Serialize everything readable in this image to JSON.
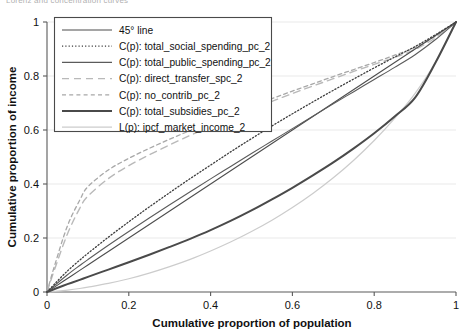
{
  "clipped_header": "Lorenz and concentration curves",
  "axes": {
    "xlabel": "Cumulative proportion of population",
    "ylabel": "Cumulative proportion of income",
    "xticks": [
      "0",
      "0.2",
      "0.4",
      "0.6",
      "0.8",
      "1"
    ],
    "yticks": [
      "0",
      "0.2",
      "0.4",
      "0.6",
      "0.8",
      "1"
    ]
  },
  "legend": {
    "items": [
      {
        "label": "45° line",
        "style": "solid",
        "color": "#4d4d4d"
      },
      {
        "label": "C(p): total_social_spending_pc_2",
        "style": "dotted",
        "color": "#3d3d3d"
      },
      {
        "label": "C(p): total_public_spending_pc_2",
        "style": "solid",
        "color": "#5b5b5b"
      },
      {
        "label": "C(p): direct_transfer_spc_2",
        "style": "long-dash",
        "color": "#b9b9b9"
      },
      {
        "label": "C(p): no_contrib_pc_2",
        "style": "short-dash",
        "color": "#a8a8a8"
      },
      {
        "label": "C(p): total_subsidies_pc_2",
        "style": "thick-solid",
        "color": "#4a4a4a"
      },
      {
        "label": "L(p): ipcf_market_income_2",
        "style": "light-solid",
        "color": "#cccccc"
      }
    ]
  },
  "chart_data": {
    "type": "line",
    "title": "",
    "xlabel": "Cumulative proportion of population",
    "ylabel": "Cumulative proportion of income",
    "xlim": [
      0,
      1
    ],
    "ylim": [
      0,
      1
    ],
    "xticks": [
      0,
      0.2,
      0.4,
      0.6,
      0.8,
      1
    ],
    "yticks": [
      0,
      0.2,
      0.4,
      0.6,
      0.8,
      1
    ],
    "grid": "horizontal-light",
    "legend_position": "upper-left-inside",
    "x": [
      0,
      0.02,
      0.05,
      0.08,
      0.1,
      0.15,
      0.2,
      0.25,
      0.3,
      0.35,
      0.4,
      0.45,
      0.5,
      0.55,
      0.6,
      0.65,
      0.7,
      0.75,
      0.8,
      0.85,
      0.9,
      0.95,
      1
    ],
    "series": [
      {
        "name": "45° line",
        "style": "solid",
        "values": [
          0,
          0.02,
          0.05,
          0.08,
          0.1,
          0.15,
          0.2,
          0.25,
          0.3,
          0.35,
          0.4,
          0.45,
          0.5,
          0.55,
          0.6,
          0.65,
          0.7,
          0.75,
          0.8,
          0.85,
          0.9,
          0.95,
          1
        ]
      },
      {
        "name": "C(p): total_social_spending_pc_2",
        "style": "dotted",
        "values": [
          0,
          0.032,
          0.078,
          0.118,
          0.143,
          0.203,
          0.26,
          0.315,
          0.368,
          0.42,
          0.47,
          0.52,
          0.568,
          0.615,
          0.66,
          0.704,
          0.747,
          0.789,
          0.83,
          0.87,
          0.909,
          0.953,
          1
        ]
      },
      {
        "name": "C(p): total_public_spending_pc_2",
        "style": "solid-thin",
        "values": [
          0,
          0.026,
          0.064,
          0.098,
          0.12,
          0.173,
          0.224,
          0.274,
          0.323,
          0.371,
          0.419,
          0.466,
          0.513,
          0.559,
          0.605,
          0.651,
          0.697,
          0.742,
          0.787,
          0.832,
          0.879,
          0.935,
          1
        ]
      },
      {
        "name": "C(p): direct_transfer_spc_2",
        "style": "long-dash",
        "values": [
          0,
          0.09,
          0.215,
          0.31,
          0.355,
          0.42,
          0.468,
          0.508,
          0.545,
          0.58,
          0.613,
          0.645,
          0.676,
          0.706,
          0.735,
          0.763,
          0.79,
          0.817,
          0.843,
          0.869,
          0.898,
          0.942,
          1
        ]
      },
      {
        "name": "C(p): no_contrib_pc_2",
        "style": "short-dash",
        "values": [
          0,
          0.105,
          0.245,
          0.34,
          0.39,
          0.452,
          0.495,
          0.532,
          0.566,
          0.598,
          0.629,
          0.659,
          0.688,
          0.716,
          0.744,
          0.771,
          0.798,
          0.824,
          0.85,
          0.877,
          0.906,
          0.948,
          1
        ]
      },
      {
        "name": "C(p): total_subsidies_pc_2",
        "style": "thick-solid",
        "values": [
          0,
          0.012,
          0.029,
          0.045,
          0.056,
          0.083,
          0.11,
          0.138,
          0.167,
          0.197,
          0.229,
          0.264,
          0.302,
          0.343,
          0.386,
          0.432,
          0.48,
          0.532,
          0.588,
          0.65,
          0.72,
          0.85,
          1
        ]
      },
      {
        "name": "L(p): ipcf_market_income_2",
        "style": "light-solid",
        "values": [
          0,
          0.002,
          0.007,
          0.013,
          0.018,
          0.032,
          0.049,
          0.07,
          0.094,
          0.121,
          0.152,
          0.186,
          0.224,
          0.266,
          0.313,
          0.365,
          0.423,
          0.488,
          0.561,
          0.643,
          0.736,
          0.852,
          1
        ]
      }
    ]
  }
}
